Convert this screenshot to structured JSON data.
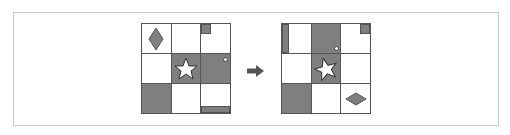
{
  "colors": {
    "fill": "#7f7f7f",
    "line": "#555555",
    "frame": "#c8c8c8",
    "background": "#ffffff"
  },
  "grids": [
    {
      "name": "before",
      "rows": 3,
      "cols": 3,
      "filled_cells": [
        [
          1,
          1
        ],
        [
          1,
          2
        ],
        [
          2,
          0
        ]
      ],
      "shapes": [
        {
          "type": "diamond-vertical",
          "cell": [
            0,
            0
          ]
        },
        {
          "type": "small-square",
          "cell": [
            0,
            2
          ],
          "position": "top-left"
        },
        {
          "type": "star",
          "cell": [
            1,
            1
          ]
        },
        {
          "type": "small-circle",
          "cell": [
            1,
            2
          ],
          "position": "top-right"
        },
        {
          "type": "bottom-bar",
          "cell": [
            2,
            2
          ]
        }
      ]
    },
    {
      "name": "after",
      "rows": 3,
      "cols": 3,
      "filled_cells": [
        [
          0,
          1
        ],
        [
          1,
          1
        ],
        [
          2,
          0
        ]
      ],
      "shapes": [
        {
          "type": "left-bar",
          "cell": [
            0,
            0
          ]
        },
        {
          "type": "small-circle",
          "cell": [
            0,
            1
          ],
          "position": "bottom-right"
        },
        {
          "type": "small-square",
          "cell": [
            0,
            2
          ],
          "position": "top-right"
        },
        {
          "type": "star-rotated",
          "cell": [
            1,
            1
          ]
        },
        {
          "type": "diamond-horizontal",
          "cell": [
            2,
            2
          ]
        }
      ]
    }
  ],
  "arrow": {
    "direction": "right",
    "icon": "right-arrow-icon"
  }
}
